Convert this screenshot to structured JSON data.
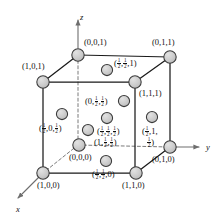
{
  "figure": {
    "type": "crystal-unit-cell-diagram",
    "colors": {
      "atom_fill": "#c9c9c9",
      "atom_stroke": "#3a3a3a",
      "edge_solid": "#1a1a1a",
      "edge_hidden": "#7a7a7a",
      "axis": "#6e6e6e",
      "background": "#ffffff"
    }
  },
  "axes": [
    {
      "name": "z-axis",
      "label": "z",
      "x": 80,
      "y": 12
    },
    {
      "name": "y-axis",
      "label": "y",
      "x": 206,
      "y": 142
    },
    {
      "name": "x-axis",
      "label": "x",
      "x": 16,
      "y": 204
    }
  ],
  "atoms": [
    {
      "id": "corner-001",
      "kind": "corner",
      "cx": 78,
      "cy": 55,
      "r": 6.2,
      "label": {
        "parts": [
          "(0,0,1)"
        ],
        "x": 84,
        "y": 38,
        "align": "left"
      }
    },
    {
      "id": "corner-011",
      "kind": "corner",
      "cx": 170,
      "cy": 57,
      "r": 6.2,
      "label": {
        "parts": [
          "(0,1,1)"
        ],
        "x": 152,
        "y": 38,
        "align": "left"
      }
    },
    {
      "id": "corner-101",
      "kind": "corner",
      "cx": 43,
      "cy": 82,
      "r": 6.2,
      "label": {
        "parts": [
          "(1,0,1)"
        ],
        "x": 22,
        "y": 62,
        "align": "left"
      }
    },
    {
      "id": "corner-111",
      "kind": "corner",
      "cx": 135,
      "cy": 82,
      "r": 6.2,
      "label": {
        "parts": [
          "(1,1,1)"
        ],
        "x": 139,
        "y": 89,
        "align": "left"
      }
    },
    {
      "id": "corner-000",
      "kind": "corner-hidden",
      "cx": 79,
      "cy": 145,
      "r": 6.2,
      "label": {
        "parts": [
          "(0,0,0)"
        ],
        "x": 69,
        "y": 153,
        "align": "left"
      }
    },
    {
      "id": "corner-010",
      "kind": "corner",
      "cx": 170,
      "cy": 147,
      "r": 6.2,
      "label": {
        "parts": [
          "(0,1,0)"
        ],
        "x": 152,
        "y": 155,
        "align": "left"
      }
    },
    {
      "id": "corner-100",
      "kind": "corner",
      "cx": 43,
      "cy": 173,
      "r": 6.2,
      "label": {
        "parts": [
          "(1,0,0)"
        ],
        "x": 37,
        "y": 181,
        "align": "left"
      }
    },
    {
      "id": "corner-110",
      "kind": "corner",
      "cx": 136,
      "cy": 173,
      "r": 6.2,
      "label": {
        "parts": [
          "(1,1,0)"
        ],
        "x": 122,
        "y": 181,
        "align": "left"
      }
    },
    {
      "id": "face-hh1",
      "kind": "face",
      "cx": 107,
      "cy": 70,
      "r": 5.6,
      "label": {
        "parts": [
          "(",
          "1/2",
          ",",
          "1/2",
          ",1)"
        ],
        "x": 114,
        "y": 58,
        "align": "left"
      }
    },
    {
      "id": "face-0hh",
      "kind": "face",
      "cx": 124,
      "cy": 101,
      "r": 5.6,
      "label": {
        "parts": [
          "(0,",
          "1/2",
          ",",
          "1/2",
          ")"
        ],
        "x": 85,
        "y": 96,
        "align": "left"
      }
    },
    {
      "id": "face-h0h",
      "kind": "face",
      "cx": 62,
      "cy": 114,
      "r": 5.6,
      "label": {
        "parts": [
          "(",
          "1/2",
          ",0,",
          "1/2",
          ")"
        ],
        "x": 39,
        "y": 123,
        "align": "left"
      }
    },
    {
      "id": "face-hhh",
      "kind": "face",
      "cx": 107,
      "cy": 118,
      "r": 5.6,
      "label": {
        "parts": [
          "(",
          "1/2",
          ",",
          "1/2",
          ",",
          "1/2",
          ")"
        ],
        "x": 97,
        "y": 126,
        "align": "left"
      }
    },
    {
      "id": "face-h1h",
      "kind": "face",
      "cx": 152,
      "cy": 117,
      "r": 5.6,
      "label": {
        "parts": [
          "(",
          "1/2",
          ",1,"
        ],
        "x": 142,
        "y": 126,
        "align": "left"
      },
      "label2": {
        "parts": [
          "1/2",
          ")"
        ],
        "x": 147,
        "y": 137,
        "align": "left"
      }
    },
    {
      "id": "face-1hh",
      "kind": "face",
      "cx": 88,
      "cy": 130,
      "r": 5.6,
      "label": {
        "parts": [
          "(1,",
          "1/2",
          ",",
          "1/2",
          ")"
        ],
        "x": 94,
        "y": 137,
        "align": "left"
      }
    },
    {
      "id": "face-hh0",
      "kind": "face",
      "cx": 106,
      "cy": 161,
      "r": 5.6,
      "label": {
        "parts": [
          "(",
          "1/2",
          ",",
          "1/2",
          ",0)"
        ],
        "x": 92,
        "y": 169,
        "align": "left"
      }
    }
  ],
  "edges_solid": [
    {
      "from": [
        78,
        55
      ],
      "to": [
        170,
        57
      ]
    },
    {
      "from": [
        78,
        55
      ],
      "to": [
        43,
        82
      ]
    },
    {
      "from": [
        43,
        82
      ],
      "to": [
        135,
        82
      ]
    },
    {
      "from": [
        170,
        57
      ],
      "to": [
        135,
        82
      ]
    },
    {
      "from": [
        43,
        82
      ],
      "to": [
        43,
        173
      ]
    },
    {
      "from": [
        170,
        57
      ],
      "to": [
        170,
        147
      ]
    },
    {
      "from": [
        135,
        82
      ],
      "to": [
        135,
        173
      ]
    },
    {
      "from": [
        43,
        173
      ],
      "to": [
        136,
        173
      ]
    },
    {
      "from": [
        136,
        173
      ],
      "to": [
        170,
        147
      ]
    }
  ],
  "edges_hidden": [
    {
      "from": [
        78,
        55
      ],
      "to": [
        78,
        145
      ]
    },
    {
      "from": [
        78,
        145
      ],
      "to": [
        170,
        147
      ]
    },
    {
      "from": [
        78,
        145
      ],
      "to": [
        43,
        173
      ]
    }
  ],
  "axis_lines": [
    {
      "from": [
        78,
        48
      ],
      "to": [
        78,
        20
      ],
      "name": "z-axis-line"
    },
    {
      "from": [
        170,
        147
      ],
      "to": [
        199,
        147
      ],
      "name": "y-axis-line"
    },
    {
      "from": [
        43,
        173
      ],
      "to": [
        18,
        198
      ],
      "name": "x-axis-line"
    }
  ]
}
